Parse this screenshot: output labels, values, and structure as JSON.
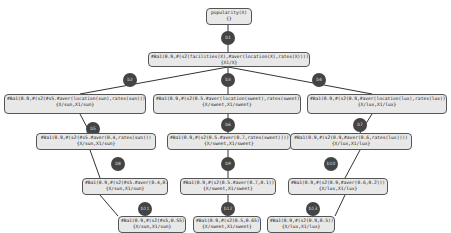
{
  "diagram": {
    "root": {
      "line1": "popularity(X)",
      "line2": "{}"
    },
    "level1": {
      "line1": "#Ba1(0.9,#(s2(facilities(X),#aver(location(X),rates(X))))",
      "line2": "{X1/X}"
    },
    "level2": [
      {
        "line1": "#Ba1(0.9,#(s2(#s5.#aver(location(sun),rates(sun))))",
        "line2": "{X/sun,X1/sun}"
      },
      {
        "line1": "#Ba1(0.9,#(s2(0.5.#aver(location(sweet),rates(sweet))))",
        "line2": "{X/sweet,X1/sweet}"
      },
      {
        "line1": "#Ba1(0.9,#(s2(0.9,#aver(location(lux),rates(lux))))",
        "line2": "{X/lux,X1/lux}"
      }
    ],
    "level3": [
      {
        "line1": "#Ba1(0.9,#(s2(#s5.#aver(0.4,rates(sun)))",
        "line2": "{X/sun,X1/sun}"
      },
      {
        "line1": "#Ba1(0.9,#(s2(0.5.#aver(0.7,rates(sweet))))",
        "line2": "{X/sweet,X1/sweet}"
      },
      {
        "line1": "#Ba1(0.9,#(s2(0.9,#aver(0.6,rates(lux))))",
        "line2": "{X/lux,X1/lux}"
      }
    ],
    "level4": [
      {
        "line1": "#Ba1(0.9,#(s2(#s5.#aver(0.4,0.7)))",
        "line2": "{X/sun,X1/sun}"
      },
      {
        "line1": "#Ba1(0.9,#(s2(0.5.#aver(0.7,0.1)))",
        "line2": "{X/sweet,X1/sweet}"
      },
      {
        "line1": "#Ba1(0.9,#(s2(0.9,#aver(0.6,0.2)))",
        "line2": "{X/lux,X1/lux}"
      }
    ],
    "level5": [
      {
        "line1": "#Ba1(0.9,#(s2(#s5,0.55)))",
        "line2": "{X/sun,X1/sun}"
      },
      {
        "line1": "#Ba1(0.9,#(s2(0.5,0.65)))",
        "line2": "{X/sweet,X1/sweet}"
      },
      {
        "line1": "#Ba1(0.9,#(s2(0.9,0.5)))",
        "line2": "{X/lux,X1/lux}"
      }
    ],
    "circles": [
      "b1",
      "b2",
      "b3",
      "b4",
      "b5",
      "b6",
      "b7",
      "b8",
      "b9",
      "b10",
      "b11",
      "b12",
      "b13"
    ]
  }
}
